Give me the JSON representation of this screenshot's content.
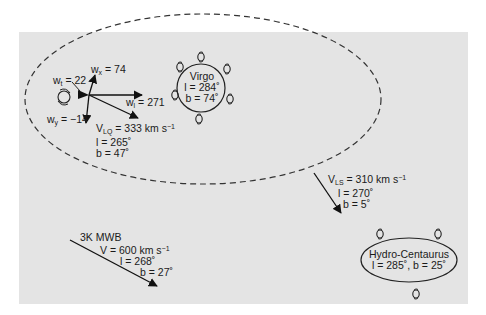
{
  "diagram": {
    "background_color": "#e4e4e4",
    "local_supercluster_boundary": "dashed ellipse",
    "vectors": {
      "wt": {
        "name": "w",
        "sub": "t",
        "value": "= 22"
      },
      "wx": {
        "name": "w",
        "sub": "x",
        "value": "= 74"
      },
      "wl": {
        "name": "w",
        "sub": "l",
        "value": "= 271"
      },
      "wy": {
        "name": "w",
        "sub": "y",
        "value": "= −14"
      }
    },
    "local_group": {
      "v_name": "V",
      "v_sub": "LQ",
      "v_value": "= 333 km s",
      "v_exp": "−1",
      "l": "l = 265˚",
      "b": "b = 47˚"
    },
    "virgo": {
      "name": "Virgo",
      "l": "l = 284˚",
      "b": "b = 74˚"
    },
    "local_supercluster": {
      "v_name": "V",
      "v_sub": "LS",
      "v_value": "= 310 km s",
      "v_exp": "−1",
      "l": "l = 270˚",
      "b": "b = 5˚"
    },
    "cmb": {
      "name": "3K MWB",
      "v": "V = 600 km s",
      "v_exp": "−1",
      "l": "l = 268˚",
      "b": "b = 27˚"
    },
    "hydra_centaurus": {
      "name": "Hydro-Centaurus",
      "coords": "l = 285˚, b = 25˚"
    }
  }
}
